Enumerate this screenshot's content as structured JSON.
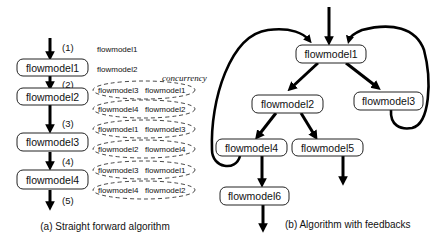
{
  "panel_a": {
    "caption": "(a) Straight forward algorithm",
    "boxes": [
      "flowmodel1",
      "flowmodel2",
      "flowmodel3",
      "flowmodel4"
    ],
    "steps": [
      "(1)",
      "(2)",
      "(3)",
      "(4)",
      "(5)"
    ],
    "step1_items": [
      "flowmodel1"
    ],
    "step2_items": [
      "flowmodel2"
    ],
    "concurrency_label": "concurrency",
    "concurrent_pairs": [
      [
        "flowmodel3",
        "flowmodel1"
      ],
      [
        "flowmodel4",
        "flowmodel2"
      ],
      [
        "flowmodel1",
        "flowmodel3"
      ],
      [
        "flowmodel2",
        "flowmodel4"
      ],
      [
        "flowmodel3",
        "flowmodel1"
      ],
      [
        "flowmodel4",
        "flowmodel2"
      ]
    ]
  },
  "panel_b": {
    "caption": "(b) Algorithm with feedbacks",
    "nodes": {
      "n1": "flowmodel1",
      "n2": "flowmodel2",
      "n3": "flowmodel3",
      "n4": "flowmodel4",
      "n5": "flowmodel5",
      "n6": "flowmodel6"
    },
    "edges": [
      [
        "input",
        "flowmodel1"
      ],
      [
        "flowmodel1",
        "flowmodel2"
      ],
      [
        "flowmodel1",
        "flowmodel3"
      ],
      [
        "flowmodel2",
        "flowmodel4"
      ],
      [
        "flowmodel2",
        "flowmodel5"
      ],
      [
        "flowmodel4",
        "flowmodel6"
      ],
      [
        "flowmodel5",
        "output"
      ],
      [
        "flowmodel6",
        "output"
      ],
      [
        "flowmodel4",
        "flowmodel1",
        "feedback"
      ],
      [
        "flowmodel3",
        "flowmodel1",
        "feedback"
      ]
    ]
  }
}
